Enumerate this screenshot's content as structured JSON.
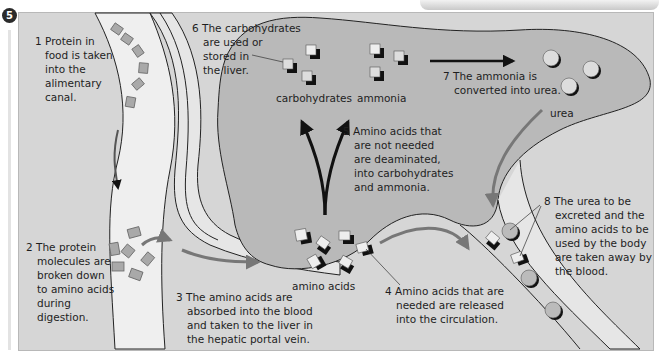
{
  "figure_number": "5",
  "colors": {
    "panel_bg": "#d6d6d6",
    "liver_fill": "#b9b9b9",
    "gut_fill": "#efefef",
    "vessel_fill": "#e6e6e6",
    "arrow_dark": "#111111",
    "arrow_grey": "#777777",
    "molecule_grey": "#a9a9a9"
  },
  "steps": [
    {
      "num": "1",
      "text_lines": [
        "Protein in",
        "food is taken",
        "into the",
        "alimentary",
        "canal."
      ]
    },
    {
      "num": "2",
      "text_lines": [
        "The protein",
        "molecules are",
        "broken down",
        "to amino acids",
        "during",
        "digestion."
      ]
    },
    {
      "num": "3",
      "text_lines": [
        "The amino acids are",
        "absorbed into the blood",
        "and taken to the liver in",
        "the hepatic portal vein."
      ]
    },
    {
      "num": "4",
      "text_lines": [
        "Amino acids that are",
        "needed are released",
        "into the circulation."
      ]
    },
    {
      "num": "5",
      "text_lines": [
        "Amino acids that",
        "are not needed",
        "are deaminated,",
        "into carbohydrates",
        "and ammonia."
      ]
    },
    {
      "num": "6",
      "text_lines": [
        "The carbohydrates",
        "are used or",
        "stored in",
        "the liver."
      ]
    },
    {
      "num": "7",
      "text_lines": [
        "The ammonia is",
        "converted into urea."
      ]
    },
    {
      "num": "8",
      "text_lines": [
        "The urea to be",
        "excreted and the",
        "amino acids to be",
        "used by the body",
        "are taken away by",
        "the blood."
      ]
    }
  ],
  "labels": {
    "carbohydrates": "carbohydrates",
    "ammonia": "ammonia",
    "urea": "urea",
    "amino_acids": "amino acids"
  }
}
